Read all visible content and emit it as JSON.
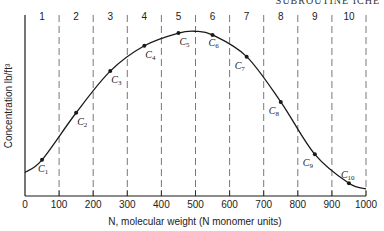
{
  "header": {
    "text": "SUBROUTINE ICHE"
  },
  "chart_data": {
    "type": "line",
    "title": "",
    "xlabel": "N, molecular weight (N monomer units)",
    "ylabel": "Concentration lb/ft³",
    "xlim": [
      0,
      1000
    ],
    "ylim": [
      0,
      100
    ],
    "y_units_note": "relative (no y tick values shown)",
    "x_ticks": [
      0,
      100,
      200,
      300,
      400,
      500,
      600,
      700,
      800,
      900,
      1000
    ],
    "x_tick_labels": [
      "0",
      "100",
      "200",
      "300",
      "400",
      "500",
      "600",
      "700",
      "800",
      "900",
      "1000"
    ],
    "grid": "vertical dashed lines at interval boundaries",
    "intervals": [
      {
        "label": "1",
        "from": 0,
        "to": 100
      },
      {
        "label": "2",
        "from": 100,
        "to": 200
      },
      {
        "label": "3",
        "from": 200,
        "to": 300
      },
      {
        "label": "4",
        "from": 300,
        "to": 400
      },
      {
        "label": "5",
        "from": 400,
        "to": 500
      },
      {
        "label": "6",
        "from": 500,
        "to": 600
      },
      {
        "label": "7",
        "from": 600,
        "to": 700
      },
      {
        "label": "8",
        "from": 700,
        "to": 800
      },
      {
        "label": "9",
        "from": 800,
        "to": 900
      },
      {
        "label": "10",
        "from": 900,
        "to": 1000
      }
    ],
    "curve": {
      "x": [
        0,
        50,
        150,
        250,
        350,
        450,
        500,
        550,
        650,
        750,
        850,
        950,
        1000
      ],
      "y": [
        13,
        20,
        46,
        69,
        83,
        90,
        91,
        89,
        77,
        52,
        23,
        7,
        4
      ]
    },
    "points": [
      {
        "label": "C",
        "sub": "1",
        "x": 50,
        "y": 20
      },
      {
        "label": "C",
        "sub": "2",
        "x": 150,
        "y": 46
      },
      {
        "label": "C",
        "sub": "3",
        "x": 250,
        "y": 69
      },
      {
        "label": "C",
        "sub": "4",
        "x": 350,
        "y": 83
      },
      {
        "label": "C",
        "sub": "5",
        "x": 450,
        "y": 90
      },
      {
        "label": "C",
        "sub": "6",
        "x": 550,
        "y": 89
      },
      {
        "label": "C",
        "sub": "7",
        "x": 650,
        "y": 77
      },
      {
        "label": "C",
        "sub": "8",
        "x": 750,
        "y": 52
      },
      {
        "label": "C",
        "sub": "9",
        "x": 850,
        "y": 23
      },
      {
        "label": "C",
        "sub": "10",
        "x": 950,
        "y": 7
      }
    ],
    "colors": {
      "line": "#1a1a1a",
      "grid": "#555555",
      "background": "#ffffff"
    }
  }
}
